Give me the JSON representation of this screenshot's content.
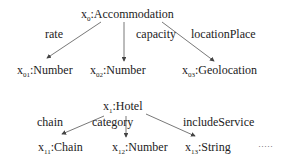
{
  "diagram": {
    "graphs": [
      {
        "root": {
          "var": "x",
          "sub": "0",
          "type": "Accommodation"
        },
        "edges": [
          {
            "label": "rate",
            "target": {
              "var": "x",
              "sub": "01",
              "type": "Number"
            }
          },
          {
            "label": "capacity",
            "target": {
              "var": "x",
              "sub": "02",
              "type": "Number"
            }
          },
          {
            "label": "locationPlace",
            "target": {
              "var": "x",
              "sub": "03",
              "type": "Geolocation"
            }
          }
        ]
      },
      {
        "root": {
          "var": "x",
          "sub": "1",
          "type": "Hotel"
        },
        "edges": [
          {
            "label": "chain",
            "target": {
              "var": "x",
              "sub": "11",
              "type": "Chain"
            }
          },
          {
            "label": "category",
            "target": {
              "var": "x",
              "sub": "12",
              "type": "Number"
            }
          },
          {
            "label": "includeService",
            "target": {
              "var": "x",
              "sub": "13",
              "type": "String"
            }
          }
        ]
      }
    ],
    "ellipsis": "·····",
    "edge_color": "#444444"
  }
}
